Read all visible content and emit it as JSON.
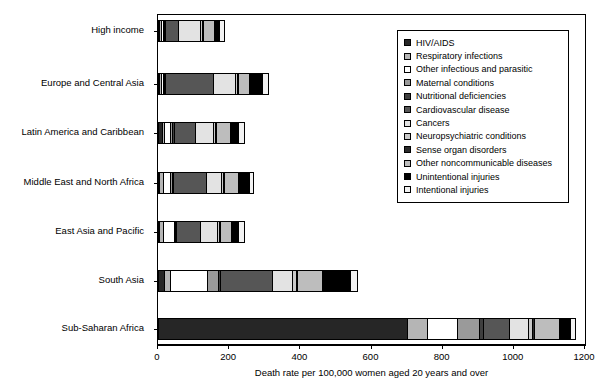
{
  "chart_data": {
    "type": "bar",
    "orientation": "horizontal",
    "stacked": true,
    "title": "",
    "xlabel": "Death rate per 100,000 women aged 20 years and over",
    "ylabel": "",
    "xlim": [
      0,
      1200
    ],
    "xticks": [
      0,
      200,
      400,
      600,
      800,
      1000,
      1200
    ],
    "grid": false,
    "legend_position": "upper right",
    "categories": [
      "High income",
      "Europe and Central Asia",
      "Latin America and Caribbean",
      "Middle East and North Africa",
      "East Asia and Pacific",
      "South Asia",
      "Sub-Saharan Africa"
    ],
    "totals": [
      182,
      305,
      240,
      265,
      238,
      556,
      1168
    ],
    "series": [
      {
        "name": "HIV/AIDS",
        "color": "#262626",
        "values": [
          2,
          3,
          10,
          2,
          4,
          18,
          700
        ]
      },
      {
        "name": "Respiratory infections",
        "color": "#b5b5b5",
        "values": [
          6,
          6,
          8,
          12,
          10,
          16,
          55
        ]
      },
      {
        "name": "Other infectious and parasitic",
        "color": "#ffffff",
        "values": [
          4,
          5,
          16,
          18,
          30,
          105,
          85
        ]
      },
      {
        "name": "Maternal conditions",
        "color": "#9a9a9a",
        "values": [
          2,
          3,
          6,
          6,
          4,
          30,
          62
        ]
      },
      {
        "name": "Nutritional deficiencies",
        "color": "#3f3f3f",
        "values": [
          2,
          2,
          4,
          3,
          3,
          6,
          12
        ]
      },
      {
        "name": "Cardiovascular disease",
        "color": "#565656",
        "values": [
          40,
          135,
          60,
          95,
          68,
          145,
          72
        ]
      },
      {
        "name": "Cancers",
        "color": "#e3e3e3",
        "values": [
          62,
          62,
          52,
          42,
          48,
          58,
          54
        ]
      },
      {
        "name": "Neuropsychiatric conditions",
        "color": "#c9c9c9",
        "values": [
          6,
          5,
          6,
          5,
          5,
          10,
          12
        ]
      },
      {
        "name": "Sense organ disorders",
        "color": "#2b2b2b",
        "values": [
          2,
          2,
          2,
          2,
          2,
          4,
          6
        ]
      },
      {
        "name": "Other noncommunicable diseases",
        "color": "#bdbdbd",
        "values": [
          32,
          32,
          38,
          40,
          30,
          70,
          68
        ]
      },
      {
        "name": "Unintentional injuries",
        "color": "#000000",
        "values": [
          14,
          38,
          24,
          30,
          22,
          78,
          32
        ]
      },
      {
        "name": "Intentional injuries",
        "color": "#f2f2f2",
        "values": [
          10,
          12,
          14,
          10,
          12,
          16,
          10
        ]
      }
    ]
  },
  "legend": {
    "items": [
      "HIV/AIDS",
      "Respiratory infections",
      "Other infectious and parasitic",
      "Maternal conditions",
      "Nutritional deficiencies",
      "Cardiovascular disease",
      "Cancers",
      "Neuropsychiatric conditions",
      "Sense organ disorders",
      "Other noncommunicable diseases",
      "Unintentional injuries",
      "Intentional injuries"
    ]
  }
}
